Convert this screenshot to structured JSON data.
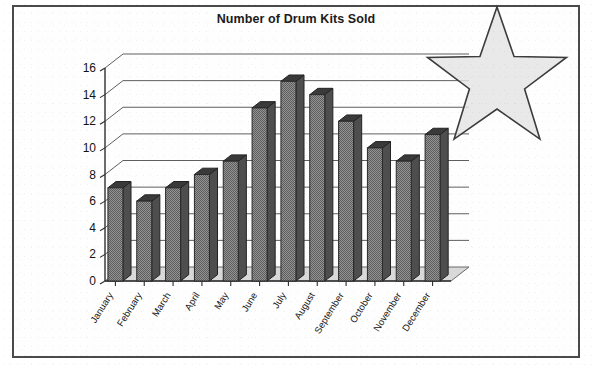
{
  "frame": {
    "border_color": "#4a4a4a",
    "background": "#fefefe"
  },
  "title": "Number of Drum Kits Sold",
  "overlay": {
    "shape": "five-pointed-star",
    "fill_color": "#e4e4e4",
    "outline_color": "#3c3c3c",
    "points": 5
  },
  "chart_data": {
    "type": "bar",
    "title": "Number of Drum Kits Sold",
    "xlabel": "",
    "ylabel": "",
    "categories": [
      "January",
      "February",
      "March",
      "April",
      "May",
      "June",
      "July",
      "August",
      "September",
      "October",
      "November",
      "December"
    ],
    "values": [
      7,
      6,
      7,
      8,
      9,
      13,
      15,
      14,
      12,
      10,
      9,
      11
    ],
    "ylim": [
      0,
      16
    ],
    "yticks": [
      0,
      2,
      4,
      6,
      8,
      10,
      12,
      14,
      16
    ],
    "ytick_labels": [
      "0",
      "2",
      "4",
      "6",
      "8",
      "10",
      "12",
      "14",
      "16"
    ],
    "grid": true,
    "legend": false,
    "style": "3d-column",
    "bar_color": "#808080",
    "bar_side_color": "#4e4e4e"
  }
}
